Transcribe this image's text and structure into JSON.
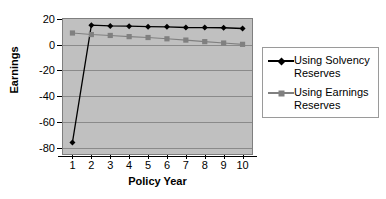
{
  "chart_data": {
    "type": "line",
    "title": "",
    "xlabel": "Policy Year",
    "ylabel": "Earnings",
    "categories": [
      1,
      2,
      3,
      4,
      5,
      6,
      7,
      8,
      9,
      10
    ],
    "xtick_labels": [
      "1",
      "2",
      "3",
      "4",
      "5",
      "6",
      "7",
      "8",
      "9",
      "10"
    ],
    "ytick_labels": [
      "20",
      "0",
      "-20",
      "-40",
      "-60",
      "-80"
    ],
    "yticks": [
      20,
      0,
      -20,
      -40,
      -60,
      -80
    ],
    "ylim": [
      -85,
      20
    ],
    "xlim": [
      0.5,
      10.5
    ],
    "grid": "horizontal",
    "legend_position": "right",
    "plot_background": "#c0c0c0",
    "series": [
      {
        "name": "Using Solvency Reserves",
        "marker": "diamond",
        "color": "#000000",
        "values": [
          -76,
          15.2,
          14.6,
          14.4,
          14.0,
          13.9,
          13.4,
          13.3,
          13.2,
          12.6
        ]
      },
      {
        "name": "Using Earnings Reserves",
        "marker": "square",
        "color": "#808080",
        "values": [
          9.1,
          7.9,
          7.2,
          6.3,
          5.6,
          4.6,
          3.6,
          2.4,
          1.3,
          0.3
        ]
      }
    ]
  },
  "legend": {
    "entries": [
      {
        "label": "Using Solvency\nReserves",
        "marker": "diamond-marker-icon",
        "color": "#000000"
      },
      {
        "label": "Using Earnings\nReserves",
        "marker": "square-marker-icon",
        "color": "#808080"
      }
    ]
  }
}
